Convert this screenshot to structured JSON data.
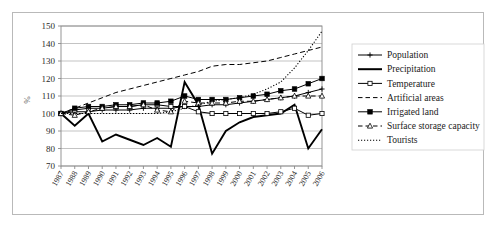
{
  "figure": {
    "frame_border_color": "#b9b9b9",
    "background": "#ffffff"
  },
  "axis": {
    "ylabel": "%",
    "yticks": [
      "150",
      "140",
      "130",
      "120",
      "110",
      "100",
      "90",
      "80",
      "70"
    ],
    "xticks": [
      "1987",
      "1988",
      "1989",
      "1990",
      "1991",
      "1992",
      "1993",
      "1994",
      "1995",
      "1996",
      "1997",
      "1998",
      "1999",
      "2000",
      "2001",
      "2002",
      "2003",
      "2004",
      "2005",
      "2006"
    ]
  },
  "legend": {
    "items": [
      {
        "label": "Population",
        "marker": "plus",
        "dash": "solid"
      },
      {
        "label": "Precipitation",
        "marker": "none",
        "dash": "solid-thick"
      },
      {
        "label": "Temperature",
        "marker": "open-square",
        "dash": "solid"
      },
      {
        "label": "Artificial areas",
        "marker": "none",
        "dash": "dashed"
      },
      {
        "label": "Irrigated land",
        "marker": "filled-square",
        "dash": "solid"
      },
      {
        "label": "Surface storage capacity",
        "marker": "open-triangle",
        "dash": "dashed"
      },
      {
        "label": "Tourists",
        "marker": "none",
        "dash": "dotted"
      }
    ]
  },
  "chart_data": {
    "type": "line",
    "title": "",
    "xlabel": "",
    "ylabel": "%",
    "ylim": [
      70,
      150
    ],
    "grid": true,
    "legend_position": "right",
    "x": [
      "1987",
      "1988",
      "1989",
      "1990",
      "1991",
      "1992",
      "1993",
      "1994",
      "1995",
      "1996",
      "1997",
      "1998",
      "1999",
      "2000",
      "2001",
      "2002",
      "2003",
      "2004",
      "2005",
      "2006"
    ],
    "series": [
      {
        "name": "Population",
        "values": [
          100,
          101,
          101,
          102,
          102,
          102,
          103,
          103,
          103,
          104,
          104,
          105,
          105,
          106,
          107,
          108,
          109,
          110,
          112,
          114
        ]
      },
      {
        "name": "Precipitation",
        "values": [
          100,
          93,
          100,
          84,
          88,
          85,
          82,
          86,
          81,
          118,
          105,
          77,
          90,
          95,
          98,
          99,
          100,
          105,
          80,
          91
        ]
      },
      {
        "name": "Temperature",
        "values": [
          100,
          102,
          103,
          103,
          104,
          104,
          105,
          105,
          104,
          104,
          101,
          100,
          100,
          100,
          100,
          100,
          101,
          103,
          99,
          100
        ]
      },
      {
        "name": "Artificial areas",
        "values": [
          100,
          103,
          106,
          109,
          112,
          114,
          116,
          118,
          120,
          122,
          124,
          127,
          128,
          128,
          129,
          130,
          132,
          134,
          136,
          138
        ]
      },
      {
        "name": "Irrigated land",
        "values": [
          100,
          103,
          104,
          104,
          105,
          105,
          106,
          106,
          107,
          110,
          108,
          108,
          108,
          109,
          110,
          111,
          113,
          114,
          117,
          120
        ]
      },
      {
        "name": "Surface storage capacity",
        "values": [
          100,
          99,
          101,
          103,
          104,
          104,
          105,
          102,
          101,
          107,
          106,
          106,
          106,
          107,
          107,
          108,
          109,
          110,
          110,
          110
        ]
      },
      {
        "name": "Tourists",
        "values": [
          100,
          100,
          100,
          100,
          100,
          100,
          100,
          100,
          101,
          103,
          105,
          107,
          108,
          109,
          111,
          114,
          118,
          126,
          136,
          147
        ]
      }
    ]
  }
}
